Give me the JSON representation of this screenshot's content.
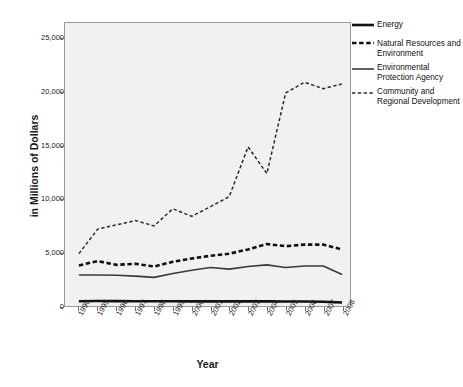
{
  "chart_data": {
    "type": "line",
    "title": "",
    "xlabel": "Year",
    "ylabel": "in Millions of Dollars",
    "ylim": [
      0,
      26500
    ],
    "yticks": [
      0,
      5000,
      10000,
      15000,
      20000,
      25000
    ],
    "ytick_labels": [
      "0",
      "5,000",
      "10,000",
      "15,000",
      "20,000",
      "25,000"
    ],
    "grid": false,
    "legend_position": "right",
    "categories": [
      "1990",
      "1995",
      "1996",
      "1997",
      "1998",
      "1999",
      "2000",
      "2001",
      "2002",
      "2003",
      "2004",
      "2005",
      "2006",
      "2007",
      "2008"
    ],
    "series": [
      {
        "name": "Energy",
        "style": "solid",
        "width": 2.6,
        "color": "#111111",
        "values": [
          450,
          470,
          460,
          450,
          440,
          440,
          430,
          430,
          430,
          430,
          430,
          420,
          420,
          400,
          330
        ]
      },
      {
        "name": "Natural Resources and Environment",
        "style": "dashed",
        "width": 2.6,
        "color": "#111111",
        "values": [
          3800,
          4200,
          3850,
          3950,
          3700,
          4150,
          4450,
          4700,
          4900,
          5300,
          5800,
          5600,
          5750,
          5750,
          5300
        ]
      },
      {
        "name": "Environmental Protection Agency",
        "style": "solid",
        "width": 1.6,
        "color": "#3a3a3a",
        "values": [
          2900,
          2900,
          2880,
          2800,
          2680,
          3050,
          3350,
          3600,
          3450,
          3700,
          3850,
          3600,
          3750,
          3750,
          2950
        ]
      },
      {
        "name": "Community and Regional Development",
        "style": "dashed",
        "width": 1.5,
        "color": "#2b2b2b",
        "values": [
          4900,
          7200,
          7600,
          8000,
          7500,
          9100,
          8400,
          9300,
          10250,
          14900,
          12400,
          19950,
          20950,
          20350,
          20800
        ]
      }
    ]
  },
  "legend": {
    "items": [
      {
        "label": "Energy",
        "icon": "solid-thick-line-icon"
      },
      {
        "label": "Natural Resources and Environment",
        "icon": "dashed-thick-line-icon"
      },
      {
        "label": "Environmental Protection Agency",
        "icon": "solid-thin-line-icon"
      },
      {
        "label": "Community and Regional Development",
        "icon": "dashed-thin-line-icon"
      }
    ]
  },
  "axes": {
    "x_title": "Year",
    "y_title": "in Millions of Dollars"
  }
}
